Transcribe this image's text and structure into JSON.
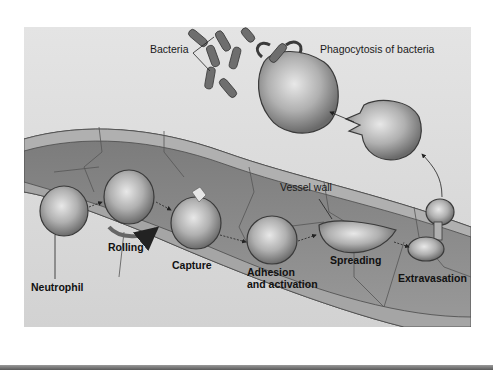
{
  "figure": {
    "labels": {
      "bacteria": "Bacteria",
      "phagocytosis": "Phagocytosis of bacteria",
      "vessel_wall": "Vessel wall",
      "neutrophil": "Neutrophil",
      "rolling": "Rolling",
      "capture": "Capture",
      "adhesion_line1": "Adhesion",
      "adhesion_line2": "and activation",
      "spreading": "Spreading",
      "extravasation": "Extravasation"
    },
    "stages": [
      "Neutrophil",
      "Rolling",
      "Capture",
      "Adhesion and activation",
      "Spreading",
      "Extravasation",
      "Phagocytosis of bacteria"
    ],
    "colors": {
      "tissue_bg": "#dcdcdc",
      "vessel_fill": "#8a8a8a",
      "vessel_wall": "#a8a8a8",
      "cell_outline": "#4a4a4a",
      "cell_fill": "#b5b5b5",
      "bacteria": "#6e6e6e"
    }
  }
}
